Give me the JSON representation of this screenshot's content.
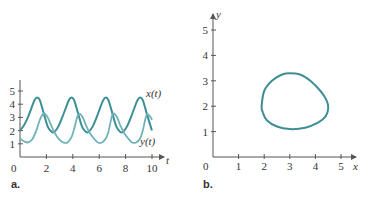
{
  "chart_data": [
    {
      "panel_label": "a.",
      "type": "line",
      "title": "",
      "xlabel": "t",
      "ylabel": "",
      "xlim": [
        0,
        10.5
      ],
      "ylim": [
        0,
        5.5
      ],
      "x_ticks": [
        0,
        2,
        4,
        6,
        8,
        10
      ],
      "y_ticks": [
        1,
        2,
        3,
        4,
        5
      ],
      "grid": false,
      "legend": "inline labels at right end of curves",
      "series": [
        {
          "name": "x(t)",
          "color": "#3e8f94",
          "t": [
            0,
            0.3,
            0.6,
            0.9,
            1.1,
            1.3,
            1.5,
            1.8,
            2.1,
            2.4,
            2.6,
            2.9,
            3.2,
            3.5,
            3.7,
            3.9,
            4.1,
            4.4,
            4.7,
            5.0,
            5.2,
            5.5,
            5.8,
            6.1,
            6.3,
            6.5,
            6.7,
            7.0,
            7.3,
            7.6,
            7.8,
            8.1,
            8.4,
            8.7,
            8.9,
            9.1,
            9.3,
            9.6,
            9.9,
            10.0
          ],
          "values": [
            2.0,
            2.4,
            3.0,
            3.8,
            4.3,
            4.5,
            4.3,
            3.3,
            2.3,
            1.9,
            1.9,
            2.3,
            3.0,
            3.8,
            4.3,
            4.5,
            4.3,
            3.3,
            2.3,
            1.9,
            1.9,
            2.3,
            3.0,
            3.8,
            4.3,
            4.5,
            4.3,
            3.3,
            2.3,
            1.9,
            1.9,
            2.3,
            3.0,
            3.8,
            4.3,
            4.5,
            4.3,
            3.3,
            2.3,
            2.0
          ]
        },
        {
          "name": "y(t)",
          "color": "#6fb3b8",
          "t": [
            0,
            0.3,
            0.6,
            0.9,
            1.2,
            1.5,
            1.8,
            2.1,
            2.4,
            2.7,
            3.0,
            3.3,
            3.6,
            3.9,
            4.1,
            4.4,
            4.7,
            5.0,
            5.3,
            5.6,
            5.9,
            6.2,
            6.5,
            6.7,
            7.0,
            7.3,
            7.6,
            7.9,
            8.2,
            8.5,
            8.8,
            9.1,
            9.3,
            9.6,
            9.9,
            10.0
          ],
          "values": [
            1.4,
            1.2,
            1.1,
            1.3,
            1.9,
            2.8,
            3.3,
            3.0,
            2.3,
            1.7,
            1.3,
            1.1,
            1.1,
            1.5,
            2.1,
            3.2,
            3.1,
            2.4,
            1.8,
            1.4,
            1.1,
            1.1,
            1.4,
            1.9,
            3.2,
            3.1,
            2.4,
            1.8,
            1.4,
            1.1,
            1.1,
            1.4,
            2.0,
            3.2,
            3.0,
            2.8
          ]
        }
      ]
    },
    {
      "panel_label": "b.",
      "type": "line",
      "title": "",
      "xlabel": "x",
      "ylabel": "y",
      "xlim": [
        0,
        5.5
      ],
      "ylim": [
        0,
        5.5
      ],
      "x_ticks": [
        0,
        1,
        2,
        3,
        4,
        5
      ],
      "y_ticks": [
        1,
        2,
        3,
        4,
        5
      ],
      "grid": false,
      "series": [
        {
          "name": "phase trajectory (x(t), y(t))",
          "color": "#3e8f94",
          "x": [
            1.9,
            2.0,
            2.3,
            2.7,
            3.0,
            3.4,
            3.8,
            4.2,
            4.45,
            4.5,
            4.4,
            4.1,
            3.6,
            3.0,
            2.5,
            2.1,
            1.95,
            1.9
          ],
          "values": [
            2.0,
            2.6,
            3.0,
            3.25,
            3.3,
            3.25,
            3.0,
            2.6,
            2.2,
            1.9,
            1.6,
            1.35,
            1.15,
            1.1,
            1.2,
            1.45,
            1.75,
            2.0
          ]
        }
      ]
    }
  ],
  "labels": {
    "panel_a": "a.",
    "panel_b": "b.",
    "a_origin": "0",
    "a_t_axis": "t",
    "a_x_series": "x(t)",
    "a_y_series": "y(t)",
    "b_origin": "0",
    "b_x_axis": "x",
    "b_y_axis": "y"
  }
}
